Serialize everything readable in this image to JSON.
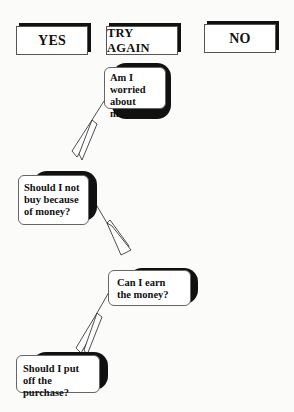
{
  "buttons": [
    {
      "label": "YES"
    },
    {
      "label": "TRY AGAIN"
    },
    {
      "label": "NO"
    }
  ],
  "questions": [
    {
      "text": "Am I worried about money?"
    },
    {
      "text": "Should I not buy because of money?"
    },
    {
      "text": "Can I earn the money?"
    },
    {
      "text": "Should I put off the purchase?"
    }
  ],
  "colors": {
    "shadow": "#111111",
    "border": "#555555",
    "background": "#fbfbf9"
  }
}
